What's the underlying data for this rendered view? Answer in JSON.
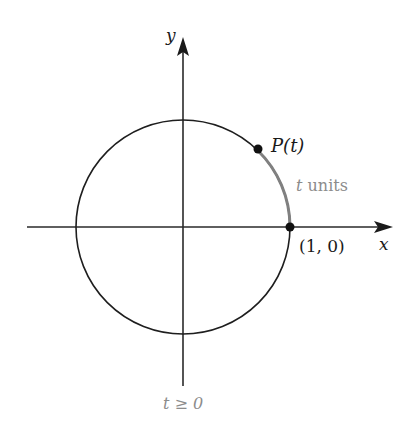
{
  "diagram": {
    "labels": {
      "y_axis": "y",
      "x_axis": "x",
      "point_p": "P(t)",
      "arc_label_var": "t",
      "arc_label_unit": " units",
      "point_origin": "(1, 0)",
      "condition": "t ≥ 0"
    },
    "colors": {
      "axis": "#2a2a2a",
      "circle": "#1e1e1e",
      "arc": "#808080",
      "gray_text": "#8c8c8c",
      "text": "#1a1a1a"
    },
    "geometry": {
      "center": [
        183,
        227
      ],
      "radius": 107,
      "p_angle_deg": 46
    }
  }
}
